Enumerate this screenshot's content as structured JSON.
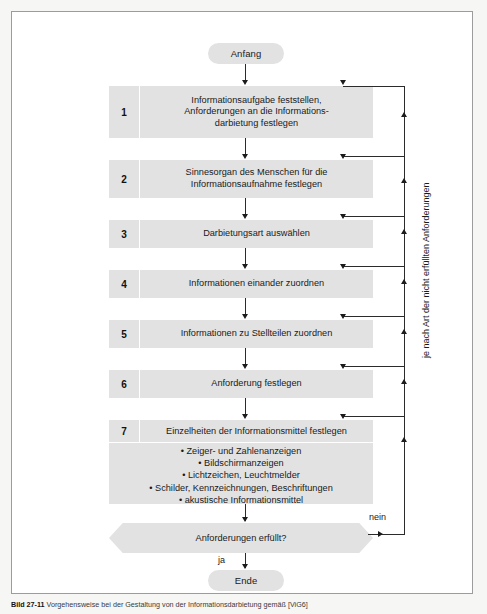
{
  "figure": {
    "start_label": "Anfang",
    "end_label": "Ende",
    "decision_label": "Anforderungen erfüllt?",
    "yes_label": "ja",
    "no_label": "nein",
    "feedback_label": "je nach Art der nicht erfüllten Anforderungen",
    "steps": [
      {
        "number": "1",
        "lines": [
          "Informationsaufgabe feststellen,",
          "Anforderungen an die Informations-",
          "darbietung festlegen"
        ]
      },
      {
        "number": "2",
        "lines": [
          "Sinnesorgan des Menschen für die",
          "Informationsaufnahme festlegen"
        ]
      },
      {
        "number": "3",
        "lines": [
          "Darbietungsart auswählen"
        ]
      },
      {
        "number": "4",
        "lines": [
          "Informationen einander zuordnen"
        ]
      },
      {
        "number": "5",
        "lines": [
          "Informationen zu Stellteilen zuordnen"
        ]
      },
      {
        "number": "6",
        "lines": [
          "Anforderung festlegen"
        ]
      },
      {
        "number": "7",
        "lines": [
          "Einzelheiten der Informationsmittel festlegen"
        ],
        "sublist": [
          "• Zeiger- und Zahlenanzeigen",
          "• Bildschirmanzeigen",
          "• Lichtzeichen, Leuchtmelder",
          "• Schilder, Kennzeichnungen, Beschriftungen",
          "• akustische Informationsmittel"
        ]
      }
    ]
  },
  "caption": {
    "prefix": "Bild 27-11",
    "text": " Vorgehensweise bei der Gestaltung von der Informationsdarbietung gemäß [ViG6]"
  },
  "colors": {
    "box_fill": "#e2e2e2",
    "line": "#2b2b2b",
    "text": "#1a1a1a",
    "frame_border": "#9c9c9c",
    "page_bg": "#f6f6f5"
  }
}
